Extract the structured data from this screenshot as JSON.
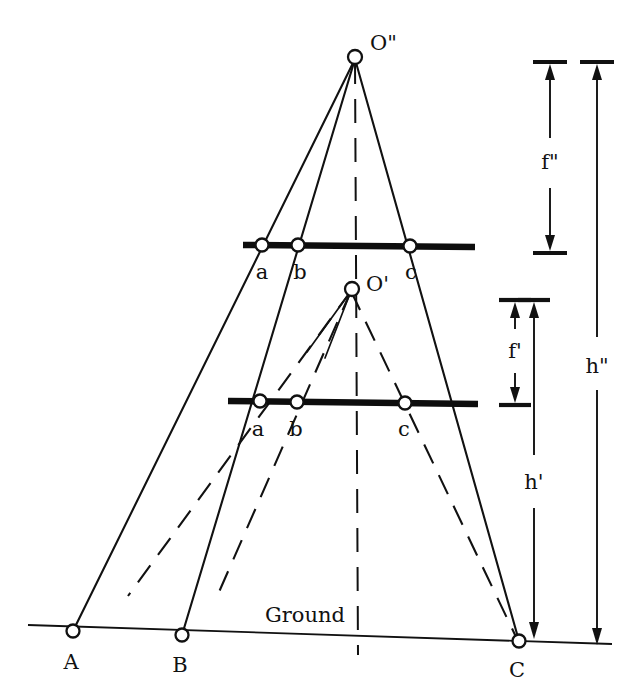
{
  "figure": {
    "background_color": "#ffffff",
    "line_color": "#111111",
    "node_fill": "#ffffff"
  },
  "labels": {
    "apex_upper": "O\"",
    "apex_lower": "O'",
    "ground": "Ground",
    "ground_point_a": "A",
    "ground_point_b": "B",
    "ground_point_c": "C",
    "image_upper_a": "a",
    "image_upper_b": "b",
    "image_upper_c": "c",
    "image_lower_a": "a",
    "image_lower_b": "b",
    "image_lower_c": "c",
    "dim_focal_upper": "f\"",
    "dim_focal_lower": "f'",
    "dim_height_upper": "h\"",
    "dim_height_lower": "h'"
  },
  "geometry": {
    "apex_upper": {
      "x": 355,
      "y": 57
    },
    "apex_lower": {
      "x": 352,
      "y": 289
    },
    "plane_upper": {
      "y": 245,
      "x1": 243,
      "x2": 475
    },
    "plane_lower": {
      "y": 402,
      "x1": 228,
      "x2": 478
    },
    "ground_line": {
      "x1": 28,
      "y1": 625,
      "x2": 612,
      "y2": 644
    },
    "ground_points": [
      {
        "label": "A",
        "x": 73,
        "y": 631
      },
      {
        "label": "B",
        "x": 182,
        "y": 635
      },
      {
        "label": "C",
        "x": 519,
        "y": 641
      }
    ],
    "image_points_upper": [
      {
        "label": "a",
        "x": 262,
        "y": 245
      },
      {
        "label": "b",
        "x": 298,
        "y": 245
      },
      {
        "label": "c",
        "x": 410,
        "y": 245
      }
    ],
    "image_points_lower": [
      {
        "label": "a",
        "x": 260,
        "y": 402
      },
      {
        "label": "b",
        "x": 297,
        "y": 402
      },
      {
        "label": "c",
        "x": 405,
        "y": 402
      }
    ],
    "optical_axis": {
      "x_top": 355,
      "y_top": 57,
      "x_bottom": 358,
      "y_bottom": 655
    }
  },
  "dimensions": [
    {
      "name": "f\"",
      "x": 550,
      "y_top": 62,
      "y_bottom": 253,
      "label_y": 163
    },
    {
      "name": "h\"",
      "x": 597,
      "y_top": 62,
      "y_bottom": 645,
      "label_y": 367
    },
    {
      "name": "f'",
      "x": 515,
      "y_top": 300,
      "y_bottom": 405,
      "label_y": 352
    },
    {
      "name": "h'",
      "x": 534,
      "y_top": 300,
      "y_bottom": 645,
      "label_y": 483
    }
  ]
}
